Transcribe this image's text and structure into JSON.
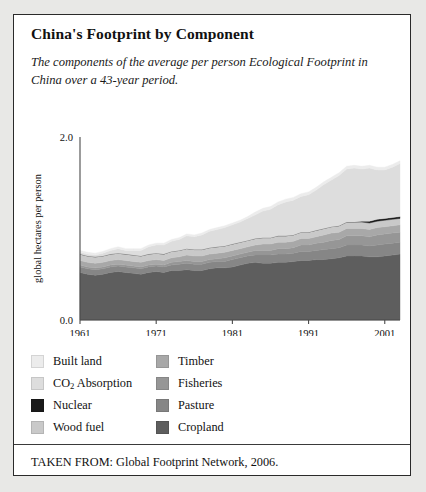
{
  "figure": {
    "title": "China's Footprint by Component",
    "subtitle": "The components of the average per person Ecological Footprint in China over a 43-year period.",
    "source": "TAKEN FROM: Global Footprint Network, 2006."
  },
  "legend": {
    "left_column": [
      {
        "label": "Built land",
        "color": "#ececec"
      },
      {
        "label": "CO2 Absorption",
        "color": "#dddddd",
        "has_subscript": true
      },
      {
        "label": "Nuclear",
        "color": "#1a1a1a"
      },
      {
        "label": "Wood fuel",
        "color": "#c9c9c9"
      }
    ],
    "right_column": [
      {
        "label": "Timber",
        "color": "#a8a8a8"
      },
      {
        "label": "Fisheries",
        "color": "#969696"
      },
      {
        "label": "Pasture",
        "color": "#868686"
      },
      {
        "label": "Cropland",
        "color": "#5e5e5e"
      }
    ]
  },
  "chart_data": {
    "type": "area",
    "stacked": true,
    "title": "China's Footprint by Component",
    "xlabel": "",
    "ylabel": "global hectares per person",
    "ylim": [
      0.0,
      2.0
    ],
    "xlim": [
      1961,
      2003
    ],
    "ytick_labels": [
      "0.0",
      "2.0"
    ],
    "ytick_values": [
      0.0,
      2.0
    ],
    "xtick_labels": [
      "1961",
      "1971",
      "1981",
      "1991",
      "2001"
    ],
    "xtick_values": [
      1961,
      1971,
      1981,
      1991,
      2001
    ],
    "grid": false,
    "legend_position": "below-plot",
    "x": [
      1961,
      1962,
      1963,
      1964,
      1965,
      1966,
      1967,
      1968,
      1969,
      1970,
      1971,
      1972,
      1973,
      1974,
      1975,
      1976,
      1977,
      1978,
      1979,
      1980,
      1981,
      1982,
      1983,
      1984,
      1985,
      1986,
      1987,
      1988,
      1989,
      1990,
      1991,
      1992,
      1993,
      1994,
      1995,
      1996,
      1997,
      1998,
      1999,
      2000,
      2001,
      2002,
      2003
    ],
    "series": [
      {
        "name": "Cropland",
        "color": "#5e5e5e",
        "values": [
          0.52,
          0.5,
          0.49,
          0.5,
          0.52,
          0.53,
          0.52,
          0.51,
          0.5,
          0.52,
          0.53,
          0.52,
          0.54,
          0.54,
          0.55,
          0.54,
          0.54,
          0.56,
          0.57,
          0.57,
          0.58,
          0.6,
          0.62,
          0.63,
          0.62,
          0.62,
          0.63,
          0.63,
          0.64,
          0.65,
          0.65,
          0.66,
          0.66,
          0.67,
          0.68,
          0.7,
          0.7,
          0.7,
          0.69,
          0.69,
          0.7,
          0.71,
          0.72
        ]
      },
      {
        "name": "Pasture",
        "color": "#868686",
        "values": [
          0.06,
          0.06,
          0.06,
          0.06,
          0.06,
          0.06,
          0.06,
          0.06,
          0.06,
          0.06,
          0.06,
          0.06,
          0.06,
          0.07,
          0.07,
          0.07,
          0.07,
          0.07,
          0.07,
          0.07,
          0.08,
          0.08,
          0.08,
          0.08,
          0.09,
          0.09,
          0.09,
          0.09,
          0.09,
          0.1,
          0.1,
          0.1,
          0.11,
          0.11,
          0.11,
          0.12,
          0.12,
          0.12,
          0.12,
          0.13,
          0.13,
          0.13,
          0.13
        ]
      },
      {
        "name": "Fisheries",
        "color": "#969696",
        "values": [
          0.02,
          0.02,
          0.02,
          0.02,
          0.02,
          0.02,
          0.02,
          0.02,
          0.02,
          0.02,
          0.02,
          0.02,
          0.03,
          0.03,
          0.03,
          0.03,
          0.03,
          0.03,
          0.03,
          0.04,
          0.04,
          0.04,
          0.04,
          0.05,
          0.05,
          0.05,
          0.06,
          0.06,
          0.06,
          0.07,
          0.07,
          0.08,
          0.08,
          0.09,
          0.09,
          0.1,
          0.1,
          0.1,
          0.1,
          0.11,
          0.11,
          0.11,
          0.11
        ]
      },
      {
        "name": "Timber",
        "color": "#a8a8a8",
        "values": [
          0.05,
          0.05,
          0.05,
          0.05,
          0.05,
          0.05,
          0.05,
          0.05,
          0.05,
          0.05,
          0.05,
          0.05,
          0.05,
          0.05,
          0.06,
          0.06,
          0.06,
          0.06,
          0.06,
          0.06,
          0.06,
          0.06,
          0.06,
          0.06,
          0.07,
          0.07,
          0.07,
          0.07,
          0.07,
          0.07,
          0.07,
          0.07,
          0.08,
          0.08,
          0.08,
          0.08,
          0.08,
          0.08,
          0.08,
          0.08,
          0.08,
          0.08,
          0.08
        ]
      },
      {
        "name": "Wood fuel",
        "color": "#c9c9c9",
        "values": [
          0.07,
          0.07,
          0.07,
          0.07,
          0.07,
          0.07,
          0.07,
          0.07,
          0.07,
          0.07,
          0.07,
          0.07,
          0.07,
          0.07,
          0.07,
          0.07,
          0.07,
          0.07,
          0.07,
          0.07,
          0.07,
          0.07,
          0.07,
          0.07,
          0.07,
          0.07,
          0.07,
          0.07,
          0.07,
          0.07,
          0.07,
          0.07,
          0.07,
          0.07,
          0.07,
          0.07,
          0.07,
          0.07,
          0.07,
          0.07,
          0.07,
          0.07,
          0.07
        ]
      },
      {
        "name": "Nuclear",
        "color": "#1a1a1a",
        "values": [
          0.0,
          0.0,
          0.0,
          0.0,
          0.0,
          0.0,
          0.0,
          0.0,
          0.0,
          0.0,
          0.0,
          0.0,
          0.0,
          0.0,
          0.0,
          0.0,
          0.0,
          0.0,
          0.0,
          0.0,
          0.0,
          0.0,
          0.0,
          0.0,
          0.0,
          0.0,
          0.0,
          0.0,
          0.0,
          0.0,
          0.0,
          0.0,
          0.0,
          0.0,
          0.0,
          0.0,
          0.0,
          0.01,
          0.02,
          0.02,
          0.02,
          0.02,
          0.02
        ]
      },
      {
        "name": "CO2 Absorption",
        "color": "#dddddd",
        "values": [
          0.02,
          0.02,
          0.02,
          0.03,
          0.04,
          0.05,
          0.04,
          0.05,
          0.06,
          0.08,
          0.09,
          0.1,
          0.11,
          0.12,
          0.14,
          0.14,
          0.16,
          0.18,
          0.19,
          0.2,
          0.21,
          0.22,
          0.24,
          0.26,
          0.29,
          0.31,
          0.34,
          0.37,
          0.38,
          0.39,
          0.41,
          0.44,
          0.48,
          0.51,
          0.55,
          0.58,
          0.59,
          0.57,
          0.58,
          0.54,
          0.53,
          0.55,
          0.58
        ]
      },
      {
        "name": "Built land",
        "color": "#ececec",
        "values": [
          0.02,
          0.02,
          0.02,
          0.02,
          0.02,
          0.02,
          0.02,
          0.02,
          0.02,
          0.02,
          0.02,
          0.02,
          0.02,
          0.02,
          0.02,
          0.02,
          0.02,
          0.02,
          0.02,
          0.02,
          0.02,
          0.02,
          0.02,
          0.03,
          0.03,
          0.03,
          0.03,
          0.03,
          0.03,
          0.03,
          0.03,
          0.03,
          0.03,
          0.03,
          0.03,
          0.03,
          0.03,
          0.03,
          0.03,
          0.03,
          0.03,
          0.03,
          0.03
        ]
      }
    ]
  }
}
